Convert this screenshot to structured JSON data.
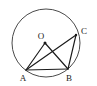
{
  "figure": {
    "background_color": "#ffffff",
    "stroke_color": "#1a1a1a",
    "circle_stroke_color": "#4a4a4a",
    "labels": {
      "center": "O",
      "vertex_a": "A",
      "vertex_b": "B",
      "vertex_c": "C"
    },
    "geometry": {
      "circle": {
        "cx": 46,
        "cy": 43,
        "r": 34
      },
      "points": {
        "O": {
          "x": 45,
          "y": 43
        },
        "A": {
          "x": 26,
          "y": 70
        },
        "B": {
          "x": 68,
          "y": 69
        },
        "C": {
          "x": 76,
          "y": 35
        }
      },
      "segments": [
        {
          "name": "OA",
          "from": "O",
          "to": "A",
          "kind": "radius"
        },
        {
          "name": "OB",
          "from": "O",
          "to": "B",
          "kind": "radius"
        },
        {
          "name": "AB",
          "from": "A",
          "to": "B",
          "kind": "chord"
        },
        {
          "name": "AC",
          "from": "A",
          "to": "C",
          "kind": "chord"
        },
        {
          "name": "BC",
          "from": "B",
          "to": "C",
          "kind": "chord"
        }
      ],
      "label_positions": {
        "O": {
          "x": 41,
          "y": 39
        },
        "A": {
          "x": 21,
          "y": 80
        },
        "B": {
          "x": 68,
          "y": 80
        },
        "C": {
          "x": 82,
          "y": 33
        }
      }
    }
  }
}
